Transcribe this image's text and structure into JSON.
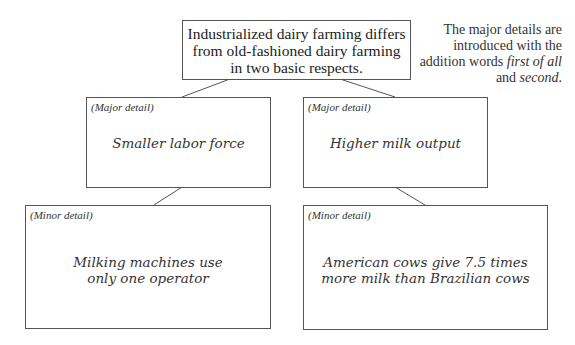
{
  "main_idea": "Industrialized dairy farming differs from old-fashioned dairy farming in two basic respects.",
  "side_note": {
    "before": "The major details are introduced with the addition words ",
    "term1": "first of all",
    "middle": " and ",
    "term2": "second",
    "after": "."
  },
  "major_details": [
    {
      "tag": "(Major detail)",
      "text": "Smaller labor force"
    },
    {
      "tag": "(Major detail)",
      "text": "Higher milk output"
    }
  ],
  "minor_details": [
    {
      "tag": "(Minor detail)",
      "line1": "Milking machines use",
      "line2": "only one operator"
    },
    {
      "tag": "(Minor detail)",
      "line1": "American cows give 7.5 times",
      "line2": "more milk than Brazilian cows"
    }
  ]
}
